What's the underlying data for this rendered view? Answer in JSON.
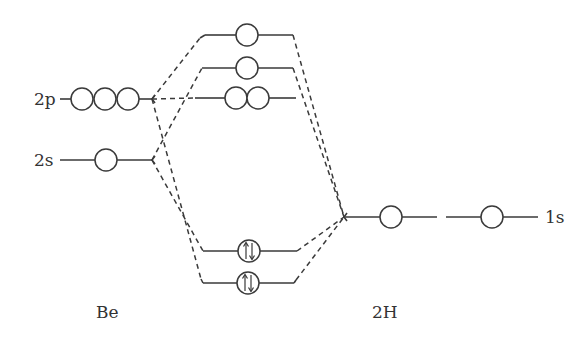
{
  "diagram": {
    "atom_labels": {
      "left": "Be",
      "right": "2H"
    },
    "be_orbitals": {
      "p": "2p",
      "s": "2s"
    },
    "h_orbitals": {
      "s": "1s"
    },
    "molecular_orbitals": [
      {
        "name": "antibonding-upper",
        "orbitals": 1,
        "electrons": 0
      },
      {
        "name": "antibonding-lower",
        "orbitals": 1,
        "electrons": 0
      },
      {
        "name": "nonbonding-2p",
        "orbitals": 2,
        "electrons": 0
      },
      {
        "name": "bonding-upper",
        "orbitals": 1,
        "electrons": 2
      },
      {
        "name": "bonding-lower",
        "orbitals": 1,
        "electrons": 2
      }
    ],
    "colors": {
      "stroke": "#3a3a3a",
      "text": "#333333",
      "background": "#ffffff"
    }
  }
}
